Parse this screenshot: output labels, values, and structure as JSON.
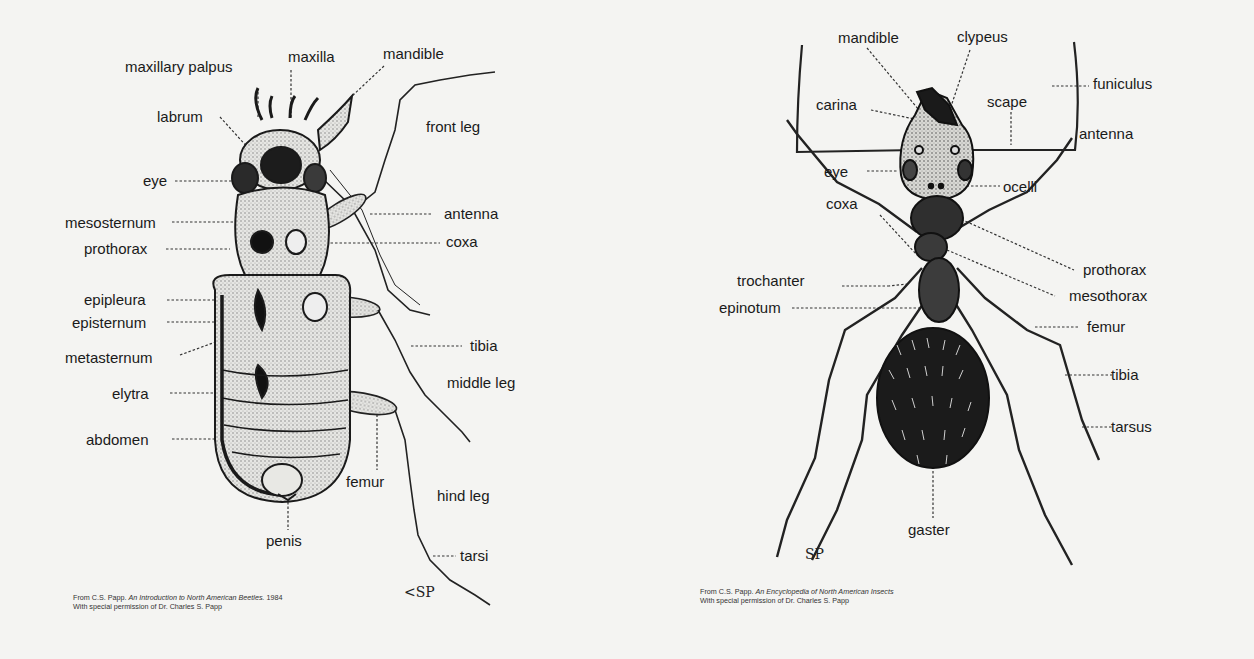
{
  "beetle": {
    "labels": {
      "maxillary_palpus": "maxillary palpus",
      "maxilla": "maxilla",
      "mandible": "mandible",
      "labrum": "labrum",
      "front_leg": "front leg",
      "eye": "eye",
      "mesosternum": "mesosternum",
      "antenna": "antenna",
      "prothorax": "prothorax",
      "coxa": "coxa",
      "epipleura": "epipleura",
      "episternum": "episternum",
      "metasternum": "metasternum",
      "tibia": "tibia",
      "elytra": "elytra",
      "middle_leg": "middle leg",
      "abdomen": "abdomen",
      "femur": "femur",
      "hind_leg": "hind leg",
      "penis": "penis",
      "tarsi": "tarsi"
    },
    "caption": {
      "line1_prefix": "From C.S. Papp.",
      "line1_title": "An Introduction to North American Beetles.",
      "line1_year": "1984",
      "line2": "With special permission of Dr. Charles S. Papp"
    },
    "signature": "<SP"
  },
  "ant": {
    "labels": {
      "mandible": "mandible",
      "clypeus": "clypeus",
      "funiculus": "funiculus",
      "carina": "carina",
      "scape": "scape",
      "antenna": "antenna",
      "eye": "eye",
      "ocelli": "ocelli",
      "coxa": "coxa",
      "prothorax": "prothorax",
      "trochanter": "trochanter",
      "mesothorax": "mesothorax",
      "epinotum": "epinotum",
      "femur": "femur",
      "tibia": "tibia",
      "tarsus": "tarsus",
      "gaster": "gaster"
    },
    "caption": {
      "line1_prefix": "From C.S. Papp.",
      "line1_title": "An Encyclopedia of North American Insects",
      "line2": "With special permission of Dr. Charles S. Papp"
    },
    "signature": "SP"
  }
}
